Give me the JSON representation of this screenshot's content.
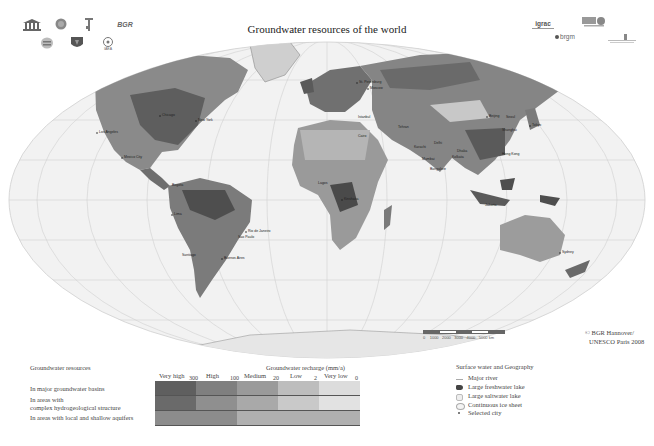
{
  "header": {
    "title": "Groundwater resources of the world",
    "logos_left": [
      "UNESCO",
      "IAH",
      "CGMW",
      "BGR",
      "IYPE",
      "IAEA shield",
      "IAEA"
    ],
    "logos_right": [
      "igrac",
      "Commission",
      "brgm",
      "Institute"
    ]
  },
  "map": {
    "cities": [
      {
        "name": "Los Angeles",
        "x": 97,
        "y": 133
      },
      {
        "name": "Chicago",
        "x": 160,
        "y": 116
      },
      {
        "name": "New York",
        "x": 196,
        "y": 121
      },
      {
        "name": "Mexico City",
        "x": 122,
        "y": 158
      },
      {
        "name": "Bogota",
        "x": 170,
        "y": 186
      },
      {
        "name": "Lima",
        "x": 172,
        "y": 215
      },
      {
        "name": "Rio de Janeiro",
        "x": 246,
        "y": 232
      },
      {
        "name": "Sao Paulo",
        "x": 236,
        "y": 238
      },
      {
        "name": "Santiago",
        "x": 180,
        "y": 256
      },
      {
        "name": "Buenos Aires",
        "x": 222,
        "y": 259
      },
      {
        "name": "St. Petersburg",
        "x": 357,
        "y": 83
      },
      {
        "name": "Moscow",
        "x": 368,
        "y": 89
      },
      {
        "name": "Istanbul",
        "x": 356,
        "y": 118
      },
      {
        "name": "Cairo",
        "x": 356,
        "y": 137
      },
      {
        "name": "Tehran",
        "x": 396,
        "y": 128
      },
      {
        "name": "Karachi",
        "x": 412,
        "y": 148
      },
      {
        "name": "Delhi",
        "x": 432,
        "y": 144
      },
      {
        "name": "Mumbai",
        "x": 420,
        "y": 160
      },
      {
        "name": "Bangalore",
        "x": 428,
        "y": 170
      },
      {
        "name": "Kolkata",
        "x": 450,
        "y": 158
      },
      {
        "name": "Dhaka",
        "x": 455,
        "y": 152
      },
      {
        "name": "Beijing",
        "x": 487,
        "y": 117
      },
      {
        "name": "Seoul",
        "x": 504,
        "y": 118
      },
      {
        "name": "Tokyo",
        "x": 530,
        "y": 126
      },
      {
        "name": "Shanghai",
        "x": 500,
        "y": 131
      },
      {
        "name": "Hong Kong",
        "x": 500,
        "y": 155
      },
      {
        "name": "Lagos",
        "x": 316,
        "y": 184
      },
      {
        "name": "Kinshasa",
        "x": 342,
        "y": 200
      },
      {
        "name": "Jakarta",
        "x": 483,
        "y": 206
      },
      {
        "name": "Sydney",
        "x": 560,
        "y": 253
      }
    ],
    "scale": {
      "ticks": [
        "0",
        "1000",
        "2000",
        "3000",
        "4000",
        "5000 km"
      ]
    },
    "copyright": [
      "© BGR Hannover/",
      "UNESCO Paris 2008"
    ]
  },
  "legend": {
    "groundwater_resources_title": "Groundwater resources",
    "recharge_title": "Groundwater recharge (mm/a)",
    "categories": [
      "Very high",
      "High",
      "Medium",
      "Low",
      "Very low"
    ],
    "ticks": [
      "300",
      "100",
      "20",
      "2",
      "0"
    ],
    "rows": [
      {
        "label": "In major groundwater basins",
        "colors": [
          "#5f5f5f",
          "#7f7f7f",
          "#9a9a9a",
          "#bdbdbd",
          "#dcdcdc"
        ]
      },
      {
        "label_line1": "In areas with",
        "label_line2": "complex hydrogeological structure",
        "colors": [
          "#6a6a6a",
          "#8f8f8f",
          "#a9a9a9",
          "#c9c9c9",
          "#e2e2e2"
        ]
      },
      {
        "label": "In areas with local and shallow aquifers",
        "colors": [
          "#8c8c8c",
          "#8c8c8c",
          "#b0b0b0",
          "#b0b0b0",
          "#b0b0b0"
        ]
      }
    ],
    "surface_title": "Surface water and Geography",
    "surface_items": [
      "Major river",
      "Large freshwater lake",
      "Large saltwater lake",
      "Continuous ice sheet",
      "Selected city"
    ]
  },
  "colors": {
    "ocean": "#f2f2f2",
    "land_dark": "#5a5a5a",
    "land_mid": "#8a8a8a",
    "land_light": "#b8b8b8",
    "graticule": "#cfcfcf"
  }
}
